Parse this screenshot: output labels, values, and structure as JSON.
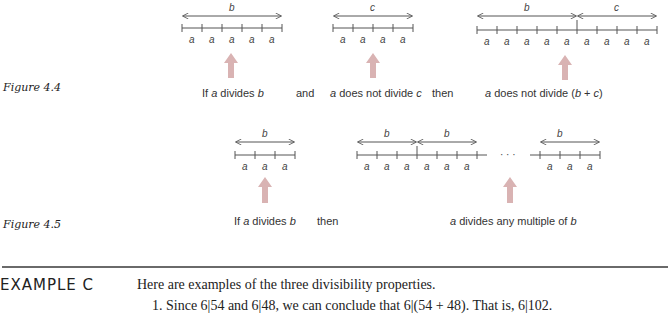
{
  "figure_4_4": {
    "label": "Figure 4.4",
    "diagram_1": {
      "span_label": "b",
      "segment_label": "a",
      "segments": 5
    },
    "diagram_2": {
      "span_label": "c",
      "segment_label": "a",
      "segments": 4
    },
    "diagram_3": {
      "span_labels": [
        "b",
        "c"
      ],
      "segment_label": "a",
      "segments": 9
    },
    "captions": {
      "c1_pre": "If ",
      "c1_var": "a",
      "c1_mid": " divides ",
      "c1_var2": "b",
      "and": "and",
      "c2_var": "a",
      "c2_mid": " does not divide ",
      "c2_var2": "c",
      "then": "then",
      "c3_var": "a",
      "c3_mid": " does not divide (",
      "c3_var2": "b",
      "c3_plus": " + ",
      "c3_var3": "c",
      "c3_end": ")"
    }
  },
  "figure_4_5": {
    "label": "Figure 4.5",
    "diagram_1": {
      "span_label": "b",
      "segment_label": "a",
      "segments": 3
    },
    "diagram_2": {
      "span_labels": [
        "b",
        "b",
        "b"
      ],
      "segment_label": "a",
      "ellipsis": "· · ·"
    },
    "captions": {
      "c1_pre": "If ",
      "c1_var": "a",
      "c1_mid": " divides ",
      "c1_var2": "b",
      "then": "then",
      "c2_var": "a",
      "c2_mid": " divides any multiple of ",
      "c2_var2": "b"
    }
  },
  "example": {
    "heading": "EXAMPLE C",
    "intro": "Here are examples of the three divisibility properties.",
    "item_1_partial": "1.  Since 6|54 and 6|48, we can conclude that 6|(54 + 48). That is, 6|102."
  },
  "colors": {
    "highlight_arrow": "#d9b3b3",
    "line": "#555555",
    "rule": "#6a6a6a"
  }
}
